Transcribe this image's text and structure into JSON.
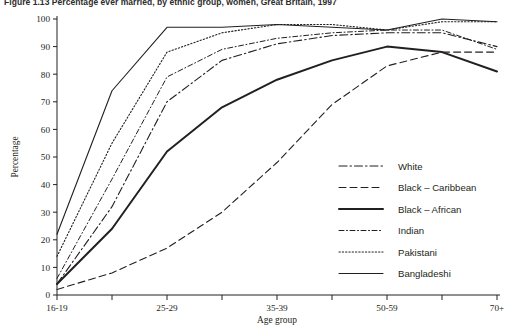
{
  "figure": {
    "title": "Figure 1.13  Percentage ever married, by ethnic group, women, Great Britain, 1997"
  },
  "chart_data": {
    "type": "line",
    "title": "Figure 1.13  Percentage ever married, by ethnic group, women, Great Britain, 1997",
    "xlabel": "Age group",
    "ylabel": "Percentage",
    "ylim": [
      0,
      100
    ],
    "ytick_step": 10,
    "yticks": [
      0,
      10,
      20,
      30,
      40,
      50,
      60,
      70,
      80,
      90,
      100
    ],
    "grid": false,
    "legend_position": "right-inside",
    "categories": [
      "16-19",
      "20-24",
      "25-29",
      "30-34",
      "35-39",
      "40-49",
      "50-59",
      "60-69",
      "70+"
    ],
    "tick_labels": [
      "16-19",
      "",
      "25-29",
      "",
      "35-39",
      "",
      "50-59",
      "",
      "70+"
    ],
    "series": [
      {
        "name": "White",
        "style": "dash-dot",
        "stroke_width": 1.1,
        "values": [
          4,
          32,
          70,
          85,
          91,
          94,
          95,
          95,
          90
        ]
      },
      {
        "name": "Black – Caribbean",
        "style": "dashed",
        "stroke_width": 1.1,
        "values": [
          2,
          8,
          17,
          30,
          48,
          69,
          83,
          88,
          88
        ]
      },
      {
        "name": "Black – African",
        "style": "solid-thick",
        "stroke_width": 2.0,
        "values": [
          4,
          24,
          52,
          68,
          78,
          85,
          90,
          88,
          81
        ]
      },
      {
        "name": "Indian",
        "style": "fine-dash-dot",
        "stroke_width": 1.0,
        "values": [
          6,
          42,
          79,
          89,
          93,
          95,
          96,
          96,
          89
        ]
      },
      {
        "name": "Pakistani",
        "style": "dotted",
        "stroke_width": 1.1,
        "values": [
          14,
          55,
          88,
          95,
          98,
          98,
          96,
          99,
          99
        ]
      },
      {
        "name": "Bangladeshi",
        "style": "solid-thin",
        "stroke_width": 1.1,
        "values": [
          22,
          74,
          97,
          97,
          98,
          97,
          96,
          100,
          99
        ]
      }
    ]
  },
  "legend": {
    "items": [
      {
        "label": "White"
      },
      {
        "label": "Black – Caribbean"
      },
      {
        "label": "Black – African"
      },
      {
        "label": "Indian"
      },
      {
        "label": "Pakistani"
      },
      {
        "label": "Bangladeshi"
      }
    ]
  }
}
